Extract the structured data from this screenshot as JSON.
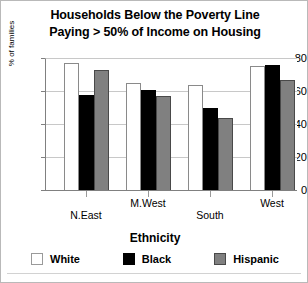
{
  "chart_data": {
    "type": "bar",
    "title": "Households Below the Poverty Line Paying > 50% of Income on Housing",
    "title_lines": [
      "Households Below the Poverty Line",
      "Paying > 50% of Income on Housing"
    ],
    "xlabel": "Ethnicity",
    "ylabel": "% of families",
    "ylim": [
      0,
      80
    ],
    "yticks": [
      0,
      20,
      40,
      60,
      80
    ],
    "ytick_labels": [
      "0",
      "20",
      "40",
      "60",
      "80"
    ],
    "grid": true,
    "legend_position": "bottom",
    "legend_title": "Ethnicity",
    "categories": [
      "N.East",
      "M.West",
      "South",
      "West"
    ],
    "series": [
      {
        "name": "White",
        "color": "#ffffff",
        "values": [
          77,
          65,
          64,
          75
        ]
      },
      {
        "name": "Black",
        "color": "#000000",
        "values": [
          58,
          61,
          50,
          76
        ]
      },
      {
        "name": "Hispanic",
        "color": "#808080",
        "values": [
          73,
          57,
          44,
          67
        ]
      }
    ]
  }
}
